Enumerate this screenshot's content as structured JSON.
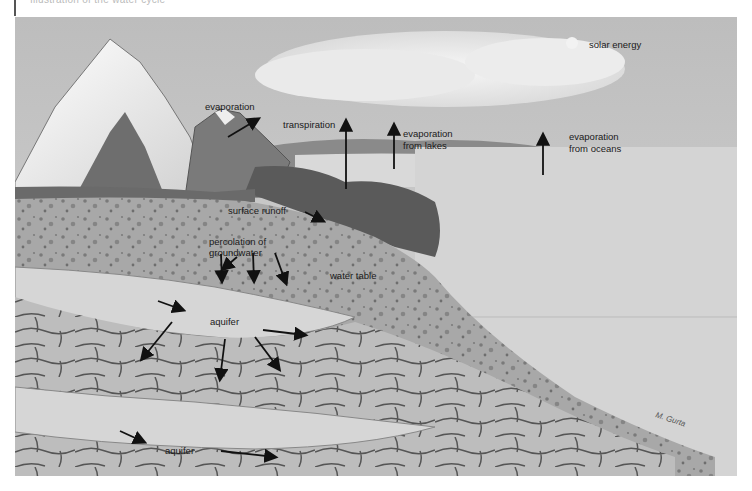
{
  "caption": {
    "text": "Illustration of the water cycle"
  },
  "diagram": {
    "title": "Water cycle",
    "style": "grayscale illustration",
    "colors": {
      "sky": "#c9c9c9",
      "cloud": "#eeeeee",
      "mountain_snow": "#f2f2f2",
      "mountain_rock": "#6f6f6f",
      "forest": "#5a5a5a",
      "soil": "#a9a9a9",
      "aquifer": "#d2d2d2",
      "rock": "#bdbdbd",
      "ocean": "#cfcfcf",
      "arrow": "#111111",
      "text": "#1a1a1a"
    },
    "labels": {
      "solar_energy": "solar energy",
      "evaporation": "evaporation",
      "transpiration": "transpiration",
      "evaporation_lakes_1": "evaporation",
      "evaporation_lakes_2": "from lakes",
      "evaporation_oceans_1": "evaporation",
      "evaporation_oceans_2": "from oceans",
      "surface_runoff": "surface runoff",
      "percolation_1": "percolation of",
      "percolation_2": "groundwater",
      "water_table": "water table",
      "aquifer_upper": "aquifer",
      "aquifer_lower": "aquifer"
    },
    "signature": "artist signature"
  }
}
